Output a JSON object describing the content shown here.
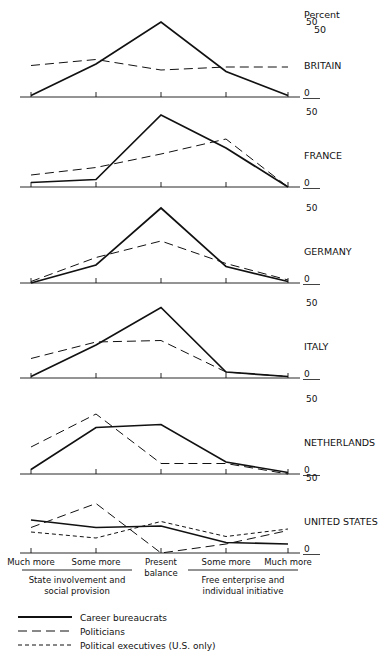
{
  "figure": {
    "percent_label": "Percent",
    "axis_top_label": "50",
    "axis_zero_label": "0",
    "panel_labels": [
      "BRITAIN",
      "FRANCE",
      "GERMANY",
      "ITALY",
      "NETHERLANDS",
      "UNITED STATES"
    ],
    "x_tick_labels": [
      "Much more",
      "Some more",
      "Present balance",
      "Some more",
      "Much more"
    ],
    "x_tick_label_lines": [
      [
        "Much more"
      ],
      [
        "Some more"
      ],
      [
        "Present",
        "balance"
      ],
      [
        "Some more"
      ],
      [
        "Much more"
      ]
    ],
    "bracket_left": [
      "State involvement and",
      "social provision"
    ],
    "bracket_right": [
      "Free enterprise and",
      "individual initiative"
    ],
    "legend": [
      {
        "label": "Career bureaucrats",
        "style": "solid"
      },
      {
        "label": "Politicians",
        "style": "long-dash"
      },
      {
        "label": "Political executives (U.S. only)",
        "style": "short-dash"
      }
    ],
    "line_color": "#111111"
  },
  "chart_data": {
    "type": "line",
    "title": "",
    "xlabel": "",
    "ylabel": "Percent",
    "ylim": [
      0,
      50
    ],
    "grid": false,
    "legend_position": "bottom-left",
    "categories": [
      "Much more",
      "Some more",
      "Present balance",
      "Some more",
      "Much more"
    ],
    "category_groups": {
      "State involvement and social provision": [
        "Much more",
        "Some more"
      ],
      "Free enterprise and individual initiative": [
        "Some more",
        "Much more"
      ]
    },
    "panels": [
      {
        "name": "BRITAIN",
        "series": [
          {
            "name": "Career bureaucrats",
            "style": "solid",
            "values": [
              1,
              22,
              50,
              17,
              1
            ]
          },
          {
            "name": "Politicians",
            "style": "long-dash",
            "values": [
              21,
              25,
              18,
              20,
              20
            ]
          }
        ]
      },
      {
        "name": "FRANCE",
        "series": [
          {
            "name": "Career bureaucrats",
            "style": "solid",
            "values": [
              3,
              5,
              48,
              26,
              0
            ]
          },
          {
            "name": "Politicians",
            "style": "long-dash",
            "values": [
              8,
              13,
              22,
              32,
              0
            ]
          }
        ]
      },
      {
        "name": "GERMANY",
        "series": [
          {
            "name": "Career bureaucrats",
            "style": "solid",
            "values": [
              0,
              12,
              50,
              11,
              1
            ]
          },
          {
            "name": "Politicians",
            "style": "long-dash",
            "values": [
              1,
              17,
              28,
              13,
              2
            ]
          }
        ]
      },
      {
        "name": "ITALY",
        "series": [
          {
            "name": "Career bureaucrats",
            "style": "solid",
            "values": [
              1,
              22,
              47,
              4,
              1
            ]
          },
          {
            "name": "Politicians",
            "style": "long-dash",
            "values": [
              13,
              24,
              25,
              4,
              1
            ]
          }
        ]
      },
      {
        "name": "NETHERLANDS",
        "series": [
          {
            "name": "Career bureaucrats",
            "style": "solid",
            "values": [
              3,
              31,
              33,
              8,
              1
            ]
          },
          {
            "name": "Politicians",
            "style": "long-dash",
            "values": [
              18,
              40,
              7,
              7,
              0
            ]
          }
        ]
      },
      {
        "name": "UNITED STATES",
        "series": [
          {
            "name": "Career bureaucrats",
            "style": "solid",
            "values": [
              22,
              17,
              18,
              7,
              6
            ]
          },
          {
            "name": "Politicians",
            "style": "long-dash",
            "values": [
              17,
              33,
              0,
              6,
              15
            ]
          },
          {
            "name": "Political executives (U.S. only)",
            "style": "short-dash",
            "values": [
              14,
              10,
              21,
              11,
              16
            ]
          }
        ]
      }
    ]
  }
}
